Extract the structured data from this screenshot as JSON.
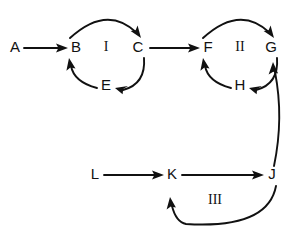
{
  "diagram": {
    "background_color": "#ffffff",
    "stroke_color": "#111111",
    "nodes": [
      {
        "id": "A",
        "label": "A",
        "x": 15,
        "y": 48
      },
      {
        "id": "B",
        "label": "B",
        "x": 76,
        "y": 48
      },
      {
        "id": "C",
        "label": "C",
        "x": 138,
        "y": 48
      },
      {
        "id": "E",
        "label": "E",
        "x": 106,
        "y": 86
      },
      {
        "id": "F",
        "label": "F",
        "x": 208,
        "y": 48
      },
      {
        "id": "G",
        "label": "G",
        "x": 271,
        "y": 48
      },
      {
        "id": "H",
        "label": "H",
        "x": 240,
        "y": 86
      },
      {
        "id": "L",
        "label": "L",
        "x": 95,
        "y": 175
      },
      {
        "id": "K",
        "label": "K",
        "x": 172,
        "y": 175
      },
      {
        "id": "J",
        "label": "J",
        "x": 272,
        "y": 175
      }
    ],
    "cycle_labels": [
      {
        "id": "I",
        "label": "I",
        "x": 106,
        "y": 48
      },
      {
        "id": "II",
        "label": "II",
        "x": 240,
        "y": 48
      },
      {
        "id": "III",
        "label": "III",
        "x": 215,
        "y": 201
      }
    ],
    "edges": [
      {
        "id": "A-B",
        "from": "A",
        "to": "B",
        "kind": "straight",
        "arrow": "to"
      },
      {
        "id": "B-C",
        "from": "B",
        "to": "C",
        "kind": "arc",
        "arrow": "to"
      },
      {
        "id": "C-E",
        "from": "C",
        "to": "E",
        "kind": "arc",
        "arrow": "to"
      },
      {
        "id": "E-B",
        "from": "E",
        "to": "B",
        "kind": "arc",
        "arrow": "to"
      },
      {
        "id": "C-F",
        "from": "C",
        "to": "F",
        "kind": "straight",
        "arrow": "to"
      },
      {
        "id": "F-G",
        "from": "F",
        "to": "G",
        "kind": "arc",
        "arrow": "to"
      },
      {
        "id": "G-H",
        "from": "G",
        "to": "H",
        "kind": "arc",
        "arrow": "to"
      },
      {
        "id": "H-F",
        "from": "H",
        "to": "F",
        "kind": "arc",
        "arrow": "to"
      },
      {
        "id": "J-G",
        "from": "J",
        "to": "G",
        "kind": "arc",
        "arrow": "to"
      },
      {
        "id": "L-K",
        "from": "L",
        "to": "K",
        "kind": "straight",
        "arrow": "to"
      },
      {
        "id": "K-J",
        "from": "K",
        "to": "J",
        "kind": "straight",
        "arrow": "to"
      },
      {
        "id": "J-K",
        "from": "J",
        "to": "K",
        "kind": "arc",
        "arrow": "to"
      }
    ]
  }
}
